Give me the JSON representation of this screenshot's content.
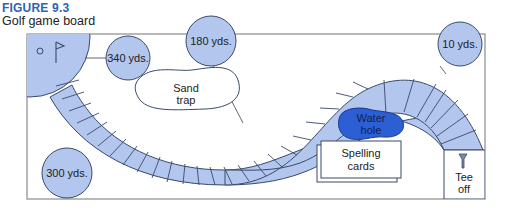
{
  "figure": {
    "label": "FIGURE 9.3",
    "caption": "Golf game board"
  },
  "board": {
    "colors": {
      "fairway": "#b3c6ee",
      "outline": "#3a4a6a",
      "water": "#2d5fd4",
      "frame": "#8a8a8a",
      "label_blue": "#2a63b8"
    },
    "markers": [
      {
        "id": "marker-340",
        "label": "340 yds."
      },
      {
        "id": "marker-180",
        "label": "180 yds."
      },
      {
        "id": "marker-10",
        "label": "10 yds."
      },
      {
        "id": "marker-300",
        "label": "300 yds."
      }
    ],
    "hazards": {
      "sand_trap": {
        "line1": "Sand",
        "line2": "trap"
      },
      "water_hole": {
        "line1": "Water",
        "line2": "hole"
      }
    },
    "spelling_cards": {
      "line1": "Spelling",
      "line2": "cards"
    },
    "tee_off": {
      "line1": "Tee",
      "line2": "off"
    },
    "green": {
      "icons": [
        "hole-cup",
        "flag"
      ]
    }
  }
}
